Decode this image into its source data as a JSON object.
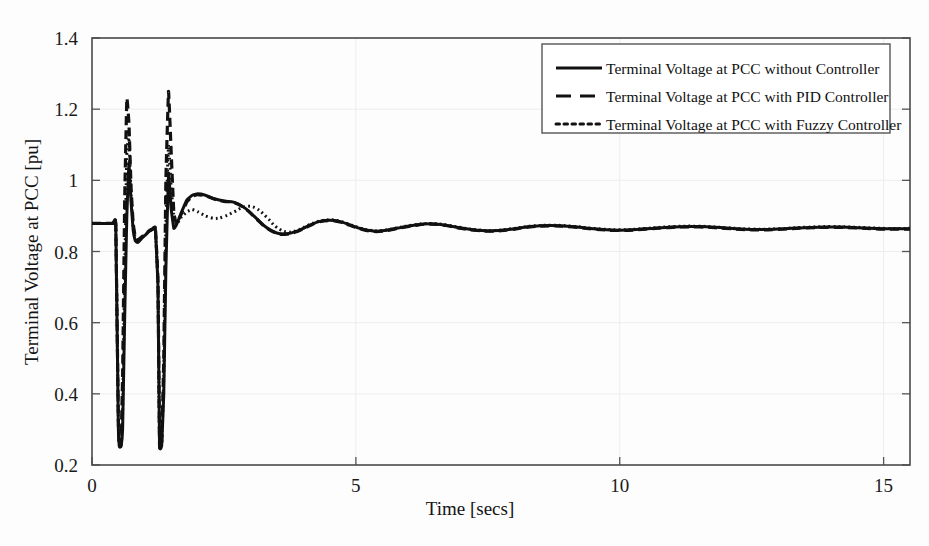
{
  "chart_data": {
    "type": "line",
    "title": "",
    "xlabel": "Time [secs]",
    "ylabel": "Terminal Voltage at PCC [pu]",
    "xlim": [
      0,
      15.5
    ],
    "ylim": [
      0.2,
      1.4
    ],
    "xticks": [
      0,
      5,
      10,
      15
    ],
    "xtick_labels": [
      "0",
      "5",
      "10",
      "15"
    ],
    "yticks": [
      0.2,
      0.4,
      0.6,
      0.8,
      1.0,
      1.2,
      1.4
    ],
    "ytick_labels": [
      "0.2",
      "0.4",
      "0.6",
      "0.8",
      "1",
      "1.2",
      "1.4"
    ],
    "grid": true,
    "legend_position": "top-right",
    "series": [
      {
        "name": "Terminal Voltage at PCC without Controller",
        "style": "solid",
        "color": "#111111",
        "x": [
          0,
          0.1,
          0.2,
          0.3,
          0.4,
          0.45,
          0.5,
          0.52,
          0.55,
          0.58,
          0.62,
          0.66,
          0.7,
          0.74,
          0.78,
          0.82,
          0.86,
          0.9,
          0.95,
          1.0,
          1.05,
          1.1,
          1.15,
          1.2,
          1.25,
          1.28,
          1.32,
          1.36,
          1.4,
          1.45,
          1.5,
          1.55,
          1.6,
          1.7,
          1.8,
          1.9,
          2.0,
          2.15,
          2.3,
          2.5,
          2.7,
          2.9,
          3.1,
          3.3,
          3.5,
          3.7,
          3.9,
          4.1,
          4.3,
          4.5,
          4.7,
          4.9,
          5.1,
          5.3,
          5.5,
          5.8,
          6.1,
          6.4,
          6.7,
          7.0,
          7.3,
          7.6,
          7.9,
          8.3,
          8.7,
          9.1,
          9.5,
          10.0,
          10.5,
          11.0,
          11.5,
          12.0,
          12.5,
          13.0,
          13.5,
          14.0,
          14.5,
          15.0,
          15.5
        ],
        "y": [
          0.879,
          0.879,
          0.879,
          0.879,
          0.879,
          0.879,
          0.3,
          0.252,
          0.252,
          0.3,
          0.62,
          0.9,
          1.05,
          0.94,
          0.86,
          0.83,
          0.825,
          0.83,
          0.838,
          0.845,
          0.852,
          0.858,
          0.862,
          0.866,
          0.7,
          0.255,
          0.255,
          0.4,
          0.75,
          1.02,
          0.92,
          0.865,
          0.875,
          0.912,
          0.945,
          0.958,
          0.962,
          0.958,
          0.949,
          0.942,
          0.938,
          0.922,
          0.895,
          0.868,
          0.852,
          0.85,
          0.858,
          0.872,
          0.884,
          0.888,
          0.884,
          0.874,
          0.864,
          0.858,
          0.858,
          0.866,
          0.874,
          0.878,
          0.874,
          0.866,
          0.86,
          0.858,
          0.862,
          0.87,
          0.873,
          0.87,
          0.864,
          0.86,
          0.864,
          0.869,
          0.87,
          0.866,
          0.862,
          0.863,
          0.867,
          0.869,
          0.867,
          0.864,
          0.864
        ]
      },
      {
        "name": "Terminal Voltage at PCC with PID Controller",
        "style": "dashed",
        "color": "#111111",
        "x": [
          0,
          0.1,
          0.2,
          0.3,
          0.4,
          0.45,
          0.5,
          0.52,
          0.55,
          0.58,
          0.62,
          0.66,
          0.7,
          0.74,
          0.78,
          0.82,
          0.86,
          0.9,
          0.95,
          1.0,
          1.05,
          1.1,
          1.15,
          1.2,
          1.25,
          1.28,
          1.32,
          1.36,
          1.4,
          1.45,
          1.5,
          1.55,
          1.6,
          1.7,
          1.8,
          1.9,
          2.0,
          2.15,
          2.3,
          2.5,
          2.7,
          2.9,
          3.1,
          3.3,
          3.5,
          3.7,
          3.9,
          4.1,
          4.3,
          4.5,
          4.7,
          4.9,
          5.1,
          5.3,
          5.5,
          5.8,
          6.1,
          6.4,
          6.7,
          7.0,
          7.3,
          7.6,
          7.9,
          8.3,
          8.7,
          9.1,
          9.5,
          10.0,
          10.5,
          11.0,
          11.5,
          12.0,
          12.5,
          13.0,
          13.5,
          14.0,
          14.5,
          15.0,
          15.5
        ],
        "y": [
          0.879,
          0.879,
          0.879,
          0.879,
          0.879,
          0.879,
          0.32,
          0.252,
          0.26,
          0.45,
          0.95,
          1.23,
          1.16,
          0.98,
          0.88,
          0.84,
          0.832,
          0.836,
          0.842,
          0.848,
          0.854,
          0.86,
          0.864,
          0.868,
          0.72,
          0.255,
          0.26,
          0.5,
          1.0,
          1.25,
          1.08,
          0.91,
          0.878,
          0.908,
          0.94,
          0.955,
          0.96,
          0.957,
          0.948,
          0.941,
          0.937,
          0.921,
          0.894,
          0.867,
          0.851,
          0.849,
          0.857,
          0.871,
          0.883,
          0.887,
          0.883,
          0.873,
          0.863,
          0.857,
          0.857,
          0.865,
          0.873,
          0.877,
          0.873,
          0.865,
          0.859,
          0.857,
          0.861,
          0.869,
          0.872,
          0.869,
          0.863,
          0.859,
          0.863,
          0.868,
          0.869,
          0.865,
          0.861,
          0.862,
          0.866,
          0.868,
          0.866,
          0.863,
          0.863
        ]
      },
      {
        "name": "Terminal Voltage at PCC with Fuzzy Controller",
        "style": "dotted",
        "color": "#111111",
        "x": [
          0,
          0.1,
          0.2,
          0.3,
          0.4,
          0.45,
          0.5,
          0.52,
          0.55,
          0.58,
          0.62,
          0.66,
          0.7,
          0.74,
          0.78,
          0.82,
          0.86,
          0.9,
          0.95,
          1.0,
          1.05,
          1.1,
          1.15,
          1.2,
          1.25,
          1.28,
          1.32,
          1.36,
          1.4,
          1.45,
          1.5,
          1.55,
          1.6,
          1.7,
          1.8,
          1.9,
          2.0,
          2.15,
          2.3,
          2.5,
          2.7,
          2.9,
          3.1,
          3.3,
          3.5,
          3.7,
          3.9,
          4.1,
          4.3,
          4.5,
          4.7,
          4.9,
          5.1,
          5.3,
          5.5,
          5.8,
          6.1,
          6.4,
          6.7,
          7.0,
          7.3,
          7.6,
          7.9,
          8.3,
          8.7,
          9.1,
          9.5,
          10.0,
          10.5,
          11.0,
          11.5,
          12.0,
          12.5,
          13.0,
          13.5,
          14.0,
          14.5,
          15.0,
          15.5
        ],
        "y": [
          0.879,
          0.879,
          0.879,
          0.879,
          0.879,
          0.879,
          0.31,
          0.252,
          0.255,
          0.35,
          0.75,
          1.08,
          1.12,
          0.96,
          0.87,
          0.835,
          0.828,
          0.832,
          0.84,
          0.847,
          0.853,
          0.859,
          0.863,
          0.867,
          0.71,
          0.255,
          0.258,
          0.45,
          0.88,
          1.1,
          0.98,
          0.9,
          0.876,
          0.898,
          0.912,
          0.918,
          0.912,
          0.9,
          0.893,
          0.898,
          0.912,
          0.926,
          0.922,
          0.898,
          0.868,
          0.855,
          0.86,
          0.874,
          0.885,
          0.889,
          0.885,
          0.875,
          0.865,
          0.859,
          0.859,
          0.867,
          0.875,
          0.879,
          0.875,
          0.867,
          0.861,
          0.859,
          0.863,
          0.871,
          0.874,
          0.871,
          0.865,
          0.861,
          0.865,
          0.87,
          0.871,
          0.867,
          0.863,
          0.864,
          0.868,
          0.87,
          0.868,
          0.865,
          0.865
        ]
      }
    ]
  },
  "legend": {
    "items": [
      {
        "label": "Terminal Voltage at PCC without Controller",
        "style": "solid"
      },
      {
        "label": "Terminal Voltage at PCC with PID Controller",
        "style": "dashed"
      },
      {
        "label": "Terminal Voltage at PCC with Fuzzy Controller",
        "style": "dotted"
      }
    ]
  }
}
